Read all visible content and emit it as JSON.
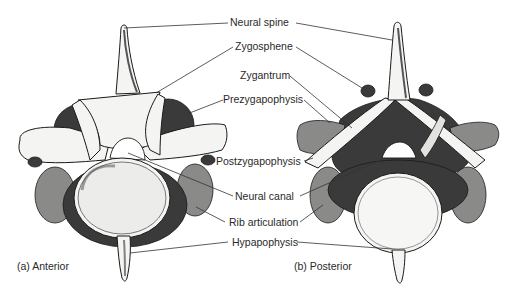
{
  "figure": {
    "views": [
      {
        "id": "anterior",
        "caption": "(a) Anterior"
      },
      {
        "id": "posterior",
        "caption": "(b) Posterior"
      }
    ],
    "labels": [
      {
        "id": "neural-spine",
        "text": "Neural spine"
      },
      {
        "id": "zygosphene",
        "text": "Zygosphene"
      },
      {
        "id": "zygantrum",
        "text": "Zygantrum"
      },
      {
        "id": "prezygapophysis",
        "text": "Prezygapophysis"
      },
      {
        "id": "postzygapophysis",
        "text": "Postzygapophysis"
      },
      {
        "id": "neural-canal",
        "text": "Neural canal"
      },
      {
        "id": "rib-articulation",
        "text": "Rib articulation"
      },
      {
        "id": "hypapophysis",
        "text": "Hypapophysis"
      }
    ]
  }
}
